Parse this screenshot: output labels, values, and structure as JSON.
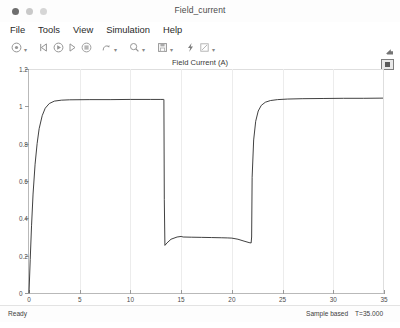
{
  "window": {
    "title": "Field_current",
    "traffic_lights": [
      "close",
      "minimize",
      "zoom"
    ]
  },
  "menu": {
    "items": [
      {
        "label": "File"
      },
      {
        "label": "Tools"
      },
      {
        "label": "View"
      },
      {
        "label": "Simulation"
      },
      {
        "label": "Help"
      }
    ]
  },
  "toolbar": {
    "buttons": [
      {
        "name": "print-icon",
        "glyph": "print"
      },
      {
        "name": "print-dropdown-icon",
        "glyph": "caret"
      },
      {
        "name": "step-back-icon",
        "glyph": "step-back"
      },
      {
        "name": "run-icon",
        "glyph": "run"
      },
      {
        "name": "step-forward-icon",
        "glyph": "step-forward"
      },
      {
        "name": "stop-icon",
        "glyph": "stop"
      },
      {
        "name": "measurements-icon",
        "glyph": "cursor"
      },
      {
        "name": "measurements-dropdown-icon",
        "glyph": "caret"
      },
      {
        "name": "zoom-icon",
        "glyph": "magnifier"
      },
      {
        "name": "zoom-dropdown-icon",
        "glyph": "caret"
      },
      {
        "name": "save-icon",
        "glyph": "save"
      },
      {
        "name": "save-dropdown-icon",
        "glyph": "caret"
      },
      {
        "name": "highlight-signal-icon",
        "glyph": "bolt"
      },
      {
        "name": "style-icon",
        "glyph": "pencil"
      },
      {
        "name": "style-dropdown-icon",
        "glyph": "caret"
      }
    ],
    "overflow_label": "toolbar-overflow"
  },
  "plot": {
    "title": "Field Current (A)",
    "legend_button": "legend-toggle"
  },
  "status": {
    "ready": "Ready",
    "mode": "Sample based",
    "time": "T=35.000"
  },
  "chart_data": {
    "type": "line",
    "title": "Field Current (A)",
    "xlabel": "",
    "ylabel": "",
    "xlim": [
      0,
      35
    ],
    "ylim": [
      0,
      1.2
    ],
    "xticks": [
      0,
      5,
      10,
      15,
      20,
      25,
      30,
      35
    ],
    "xtick_labels": [
      "0",
      "5",
      "10",
      "15",
      "20",
      "25",
      "30",
      "35"
    ],
    "yticks": [
      0,
      0.2,
      0.4,
      0.6,
      0.8,
      1.0,
      1.2
    ],
    "ytick_labels": [
      "0",
      "0.2",
      "0.4",
      "0.6",
      "0.8",
      "1",
      "1.2"
    ],
    "grid": true,
    "legend": null,
    "line_color": "#2b2b2b",
    "series": [
      {
        "name": "Field Current",
        "x": [
          0.0,
          0.12,
          0.25,
          0.4,
          0.6,
          0.8,
          1.0,
          1.3,
          1.6,
          2.0,
          2.5,
          3.2,
          4.0,
          6.0,
          8.0,
          10.0,
          12.0,
          13.0,
          13.25,
          13.3,
          13.34,
          13.4,
          13.6,
          14.0,
          14.6,
          15.0,
          15.2,
          16.0,
          17.0,
          18.0,
          19.0,
          19.6,
          20.0,
          20.6,
          21.2,
          21.7,
          21.9,
          21.95,
          22.0,
          22.15,
          22.35,
          22.6,
          22.9,
          23.3,
          23.8,
          24.5,
          25.5,
          27.0,
          29.0,
          31.0,
          33.0,
          35.0
        ],
        "y": [
          0.0,
          0.18,
          0.36,
          0.53,
          0.69,
          0.8,
          0.88,
          0.95,
          0.99,
          1.015,
          1.028,
          1.033,
          1.035,
          1.036,
          1.036,
          1.037,
          1.037,
          1.037,
          1.037,
          1.037,
          0.5,
          0.255,
          0.268,
          0.288,
          0.3,
          0.303,
          0.3,
          0.299,
          0.298,
          0.297,
          0.296,
          0.295,
          0.294,
          0.288,
          0.278,
          0.27,
          0.268,
          0.3,
          0.62,
          0.82,
          0.92,
          0.975,
          1.005,
          1.022,
          1.031,
          1.036,
          1.039,
          1.041,
          1.042,
          1.043,
          1.043,
          1.044
        ],
        "annotations": [
          {
            "label": "initial-exponential-rise",
            "x_range": [
              0.0,
              2.5
            ]
          },
          {
            "label": "first-plateau",
            "value": 1.037,
            "x_range": [
              2.5,
              13.3
            ]
          },
          {
            "label": "step-down-edge",
            "x": 13.3
          },
          {
            "label": "low-plateau",
            "value": 0.3,
            "x_range": [
              13.4,
              21.9
            ]
          },
          {
            "label": "step-up-edge",
            "x": 21.95
          },
          {
            "label": "second-plateau",
            "value": 1.043,
            "x_range": [
              24.0,
              35.0
            ]
          }
        ]
      }
    ]
  }
}
